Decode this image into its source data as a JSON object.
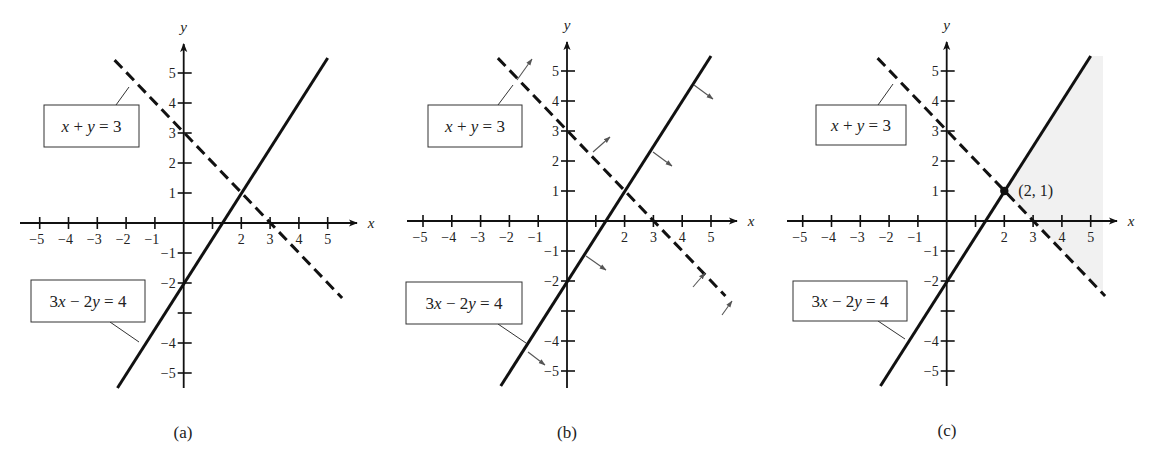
{
  "figure": {
    "panels": [
      {
        "id": "a",
        "caption": "(a)",
        "origin": [
          183.7,
          223
        ],
        "unit": [
          28.8,
          30
        ],
        "x_axis": {
          "from": 20,
          "to": 357,
          "label": "x"
        },
        "y_axis": {
          "from": 388,
          "to": 44,
          "label": "y"
        },
        "x_ticks": [
          -5,
          -4,
          -3,
          -2,
          -1,
          1,
          2,
          3,
          4,
          5
        ],
        "x_tick_labels": {
          "-5": "−5",
          "-4": "−4",
          "-3": "−3",
          "-2": "−2",
          "-1": "−1",
          "2": "2",
          "3": "3",
          "4": "4",
          "5": "5"
        },
        "y_ticks": [
          5,
          4,
          3,
          2,
          1,
          -1,
          -2,
          -3,
          -4,
          -5
        ],
        "y_tick_labels": {
          "5": "5",
          "4": "4",
          "3": "3",
          "2": "2",
          "1": "1",
          "-1": "−1",
          "-2": "−2",
          "-4": "−4",
          "-5": "−5"
        },
        "lines": [
          {
            "name": "x-plus-y-equals-3",
            "style": "dashed",
            "p1": [
              -2.4,
              5.43
            ],
            "p2": [
              5.5,
              -2.5
            ]
          },
          {
            "name": "3x-minus-2y-equals-4",
            "style": "solid",
            "p1": [
              -2.3,
              -5.5
            ],
            "p2": [
              5.0,
              5.5
            ]
          }
        ],
        "labels": [
          {
            "name": "label-x-plus-y-3",
            "text": "x + y = 3",
            "box": [
              44,
              105,
              95,
              42
            ],
            "leader": [
              [
                116,
                105
              ],
              [
                129,
                87
              ]
            ]
          },
          {
            "name": "label-3x-minus-2y-4",
            "text": "3x − 2y = 4",
            "box": [
              31,
              280,
              114,
              42
            ],
            "leader": [
              [
                110,
                322
              ],
              [
                139,
                342
              ]
            ]
          }
        ],
        "normal_arrows": [],
        "shade": null,
        "point": null,
        "caption_pos": [
          183,
          432
        ]
      },
      {
        "id": "b",
        "caption": "(b)",
        "origin": [
          567,
          221
        ],
        "unit": [
          28.8,
          30
        ],
        "x_axis": {
          "from": 407,
          "to": 737,
          "label": "x"
        },
        "y_axis": {
          "from": 388,
          "to": 42,
          "label": "y"
        },
        "x_ticks": [
          -5,
          -4,
          -3,
          -2,
          -1,
          1,
          2,
          3,
          4,
          5
        ],
        "x_tick_labels": {
          "-5": "−5",
          "-4": "−4",
          "-3": "−3",
          "-2": "−2",
          "-1": "−1",
          "2": "2",
          "3": "3",
          "4": "4",
          "5": "5"
        },
        "y_ticks": [
          5,
          4,
          3,
          2,
          1,
          -1,
          -2,
          -3,
          -4,
          -5
        ],
        "y_tick_labels": {
          "5": "5",
          "4": "4",
          "3": "3",
          "2": "2",
          "1": "1",
          "-1": "−1",
          "-2": "−2",
          "-4": "−4",
          "-5": "−5"
        },
        "lines": [
          {
            "name": "x-plus-y-equals-3",
            "style": "dashed",
            "p1": [
              -2.4,
              5.43
            ],
            "p2": [
              5.5,
              -2.5
            ]
          },
          {
            "name": "3x-minus-2y-equals-4",
            "style": "solid",
            "p1": [
              -2.3,
              -5.5
            ],
            "p2": [
              5.0,
              5.5
            ]
          }
        ],
        "labels": [
          {
            "name": "label-x-plus-y-3",
            "text": "x + y = 3",
            "box": [
              428,
              105,
              94,
              42
            ],
            "leader": [
              [
                498,
                105
              ],
              [
                513,
                85
              ]
            ]
          },
          {
            "name": "label-3x-minus-2y-4",
            "text": "3x − 2y = 4",
            "box": [
              406,
              282,
              116,
              42
            ],
            "leader": [
              [
                498,
                324
              ],
              [
                526,
                343
              ]
            ]
          }
        ],
        "normal_arrows": [
          {
            "from": [
              517,
              80
            ],
            "to": [
              532,
              59
            ]
          },
          {
            "from": [
              593,
              152
            ],
            "to": [
              610,
              137
            ]
          },
          {
            "from": [
              693,
              287
            ],
            "to": [
              705,
              273
            ]
          },
          {
            "from": [
              722,
              315
            ],
            "to": [
              732,
              301
            ]
          },
          {
            "from": [
              694,
              85
            ],
            "to": [
              713,
              99
            ]
          },
          {
            "from": [
              653,
              152
            ],
            "to": [
              672,
              166
            ]
          },
          {
            "from": [
              586,
              256
            ],
            "to": [
              606,
              270
            ]
          },
          {
            "from": [
              528,
              352
            ],
            "to": [
              545,
              365
            ]
          }
        ],
        "shade": null,
        "point": null,
        "caption_pos": [
          567,
          432
        ]
      },
      {
        "id": "c",
        "caption": "(c)",
        "origin": [
          946.7,
          221
        ],
        "unit": [
          28.8,
          30
        ],
        "x_axis": {
          "from": 787,
          "to": 1117,
          "label": "x"
        },
        "y_axis": {
          "from": 386,
          "to": 42,
          "label": "y"
        },
        "x_ticks": [
          -5,
          -4,
          -3,
          -2,
          -1,
          1,
          2,
          3,
          4,
          5
        ],
        "x_tick_labels": {
          "-5": "−5",
          "-4": "−4",
          "-3": "−3",
          "-2": "−2",
          "-1": "−1",
          "2": "2",
          "3": "3",
          "4": "4",
          "5": "5"
        },
        "y_ticks": [
          5,
          4,
          3,
          2,
          1,
          -1,
          -2,
          -3,
          -4,
          -5
        ],
        "y_tick_labels": {
          "5": "5",
          "4": "4",
          "3": "3",
          "2": "2",
          "1": "1",
          "-1": "−1",
          "-2": "−2",
          "-4": "−4",
          "-5": "−5"
        },
        "lines": [
          {
            "name": "x-plus-y-equals-3",
            "style": "dashed",
            "p1": [
              -2.4,
              5.43
            ],
            "p2": [
              5.5,
              -2.5
            ]
          },
          {
            "name": "3x-minus-2y-equals-4",
            "style": "solid",
            "p1": [
              -2.3,
              -5.5
            ],
            "p2": [
              5.0,
              5.5
            ]
          }
        ],
        "labels": [
          {
            "name": "label-x-plus-y-3",
            "text": "x + y = 3",
            "box": [
              816,
              105,
              90,
              40
            ],
            "leader": [
              [
                878,
                105
              ],
              [
                893,
                84
              ]
            ]
          },
          {
            "name": "label-3x-minus-2y-4",
            "text": "3x − 2y = 4",
            "box": [
              793,
              281,
              114,
              40
            ],
            "leader": [
              [
                878,
                321
              ],
              [
                905,
                339
              ]
            ]
          }
        ],
        "normal_arrows": [],
        "shade": {
          "color": "#f1f1f1",
          "polygon": [
            [
              1090,
              56
            ],
            [
              1103,
              56
            ],
            [
              1103,
              292
            ],
            [
              1004,
              191
            ]
          ]
        },
        "point": {
          "xy": [
            2,
            1
          ],
          "label": "(2, 1)",
          "label_offset": [
            14,
            5
          ]
        },
        "caption_pos": [
          947,
          430
        ]
      }
    ]
  }
}
